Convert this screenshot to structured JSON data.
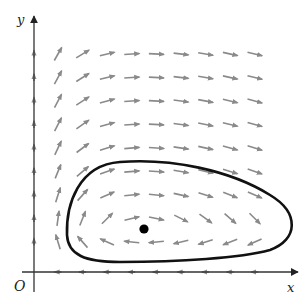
{
  "diagram": {
    "type": "direction-field-phase-plane",
    "axes": {
      "x_label": "x",
      "y_label": "y",
      "origin_label": "O"
    },
    "colors": {
      "field_arrow": "#8a8a8a",
      "axis": "#333333",
      "trajectory": "#111111",
      "equilibrium": "#000000",
      "background": "#ffffff"
    },
    "field_grid": {
      "columns": 9,
      "rows": 9
    },
    "elements": [
      "direction field arrows",
      "closed trajectory (periodic orbit)",
      "equilibrium point"
    ]
  }
}
